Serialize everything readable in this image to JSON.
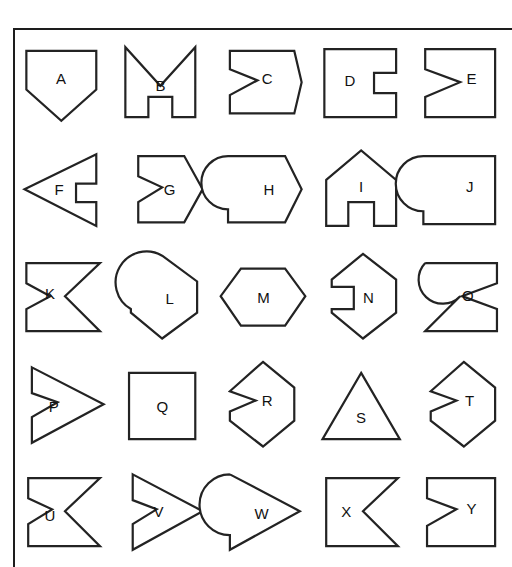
{
  "page": {
    "background_color": "#ffffff",
    "stroke_color": "#232323",
    "fill_color": "#ffffff",
    "frame": {
      "name": "outer-frame",
      "visible_edges": [
        "top",
        "left"
      ],
      "color": "#1d1d1d"
    },
    "grid": {
      "rows": 5,
      "columns": 5,
      "cell_count": 25
    }
  },
  "shapes": [
    {
      "label": "A",
      "description": "pentagon, flat top, point at bottom",
      "points": "8,14 84,14 84,56 46,90 8,56",
      "label_x": 46,
      "label_y": 44
    },
    {
      "label": "B",
      "description": "M shape with V notch at top and rectangular notch at bottom center",
      "points": "8,10 8,86 33,86 33,64 59,64 59,86 84,86 84,10 46,52",
      "label_x": 46,
      "label_y": 51
    },
    {
      "label": "C",
      "description": "right pointing arrow pentagon with Z notch on left side",
      "points": "14,14 84,14 92,48 84,82 14,82 14,62 44,46 14,34",
      "label_x": 54,
      "label_y": 44
    },
    {
      "label": "D",
      "description": "square with rectangular notch cut into right side",
      "points": "8,12 86,12 86,38 62,38 62,60 86,60 86,86 8,86",
      "label_x": 36,
      "label_y": 46
    },
    {
      "label": "E",
      "description": "square with V notch cut into left side",
      "points": "10,12 86,12 86,86 10,86 10,64 48,48 10,34",
      "label_x": 60,
      "label_y": 44
    },
    {
      "label": "F",
      "description": "left pointing triangle with rectangular notch on right side",
      "points": "6,48 84,10 84,42 62,42 62,62 84,62 84,88",
      "label_x": 44,
      "label_y": 48
    },
    {
      "label": "G",
      "description": "right pointing hexagon arrow with Z notch on left side",
      "points": "22,12 72,12 92,48 72,84 22,84 22,62 48,46 22,34",
      "label_x": 56,
      "label_y": 48
    },
    {
      "label": "H",
      "description": "right pointing arrow pentagon with circular bite on left side",
      "points": "12,12 74,12 92,48 74,84 12,84 12,70",
      "arc": "circular-bite-left",
      "label_x": 56,
      "label_y": 48
    },
    {
      "label": "I",
      "description": "house pentagon with rectangular notch at bottom center",
      "points": "10,38 48,6 86,38 86,88 62,88 62,62 34,62 34,88 10,88",
      "label_x": 48,
      "label_y": 44
    },
    {
      "label": "J",
      "description": "square with circular bite on left side",
      "points": "8,12 86,12 86,86 8,86 8,72",
      "arc": "circular-bite-left",
      "label_x": 58,
      "label_y": 44
    },
    {
      "label": "K",
      "description": "rectangle with V notch on right side and Z notch on left side",
      "points": "8,12 88,12 50,48 88,86 8,86 8,62 34,48 8,34",
      "label_x": 34,
      "label_y": 44
    },
    {
      "label": "L",
      "description": "vertical hexagon with circular bite on left side",
      "points": "48,4 86,32 86,66 48,94 14,66 14,62",
      "arc": "circular-bite-left",
      "label_x": 56,
      "label_y": 50
    },
    {
      "label": "M",
      "description": "horizontal hexagon",
      "points": "26,18 74,18 96,48 74,80 26,80 4,48",
      "label_x": 50,
      "label_y": 48
    },
    {
      "label": "N",
      "description": "vertical hexagon with rectangular notch on left side",
      "points": "50,2 86,30 86,66 50,94 16,66 16,62 40,62 40,38 16,38 16,30",
      "label_x": 56,
      "label_y": 48
    },
    {
      "label": "O",
      "description": "rectangle with V notch on left side and circular bite on right side",
      "points": "10,12 88,12 88,34 50,48 88,62 88,86 10,86 48,48",
      "arc": "circular-bite-right",
      "label_x": 56,
      "label_y": 46
    },
    {
      "label": "P",
      "description": "right pointing triangle with Z notch on left side",
      "points": "14,8 92,48 14,90 14,62 42,46 14,36",
      "label_x": 38,
      "label_y": 50
    },
    {
      "label": "Q",
      "description": "plain square",
      "points": "12,14 84,14 84,86 12,86",
      "label_x": 48,
      "label_y": 50
    },
    {
      "label": "R",
      "description": "vertical hexagon with Z notch on left side",
      "points": "50,2 84,30 84,66 50,94 14,66 14,56 42,44 14,34",
      "label_x": 54,
      "label_y": 44
    },
    {
      "label": "S",
      "description": "triangle pointing up",
      "points": "48,14 90,86 6,86",
      "label_x": 48,
      "label_y": 62
    },
    {
      "label": "T",
      "description": "vertical hexagon with Z notch on left side",
      "points": "52,2 86,30 86,66 52,94 16,66 16,56 44,44 16,34",
      "label_x": 58,
      "label_y": 44
    },
    {
      "label": "U",
      "description": "rectangle with V notch on right side and Z notch on left side",
      "points": "10,12 88,12 50,48 88,86 10,86 10,62 36,46 10,34",
      "label_x": 34,
      "label_y": 52
    },
    {
      "label": "V",
      "description": "right pointing triangle with Z notch on left side",
      "points": "16,8 92,48 16,90 16,62 42,46 16,36",
      "label_x": 44,
      "label_y": 48
    },
    {
      "label": "W",
      "description": "right pointing triangle with circular bite on left side",
      "points": "14,8 90,48 14,90 14,74",
      "arc": "circular-bite-left",
      "label_x": 48,
      "label_y": 50
    },
    {
      "label": "X",
      "description": "square with V notch cut into right side",
      "points": "10,12 88,12 50,48 88,86 10,86",
      "label_x": 32,
      "label_y": 48
    },
    {
      "label": "Y",
      "description": "square with Z notch on left side",
      "points": "12,12 86,12 86,86 12,86 12,64 44,46 12,34",
      "label_x": 60,
      "label_y": 44
    }
  ]
}
